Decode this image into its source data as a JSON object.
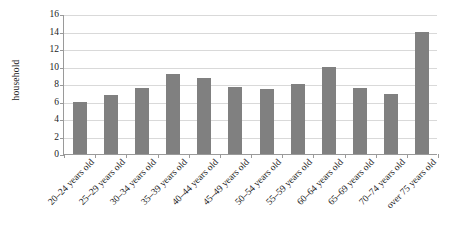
{
  "chart_data": {
    "type": "bar",
    "title": "",
    "xlabel": "",
    "ylabel": "household",
    "ylim": [
      0,
      16
    ],
    "ytick_step": 2,
    "yticks": [
      0,
      2,
      4,
      6,
      8,
      10,
      12,
      14,
      16
    ],
    "grid": true,
    "legend": null,
    "bar_color": "#808080",
    "categories": [
      "20–24 years old",
      "25–29 years old",
      "30–34 years old",
      "35–39 years old",
      "40–44 years old",
      "45–49 years old",
      "50–54 years old",
      "55–59 years old",
      "60–64 years old",
      "65–69 years old",
      "70–74 years old",
      "over 75 years old"
    ],
    "values": [
      6.0,
      6.8,
      7.6,
      9.1,
      8.7,
      7.7,
      7.4,
      8.0,
      9.9,
      7.5,
      6.9,
      13.9
    ]
  }
}
